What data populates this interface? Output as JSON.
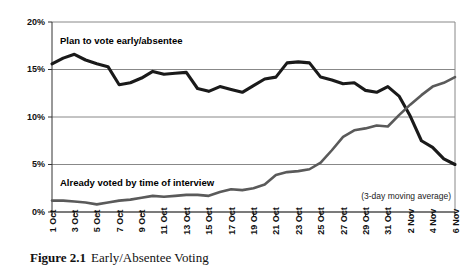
{
  "caption": {
    "number": "Figure 2.1",
    "title": "Early/Absentee Voting"
  },
  "annotations": {
    "series1_label": "Plan to vote early/absentee",
    "series2_label": "Already voted by time of interview",
    "note": "(3-day moving average)"
  },
  "colors": {
    "series1": "#1a1a1a",
    "series2": "#5a5a5a",
    "grid": "#888888",
    "axis": "#333333",
    "background": "#ffffff"
  },
  "chart_data": {
    "type": "line",
    "title": "Early/Absentee Voting",
    "xlabel": "",
    "ylabel": "",
    "ylim": [
      0,
      20
    ],
    "yticks": [
      0,
      5,
      10,
      15,
      20
    ],
    "ytick_labels": [
      "0%",
      "5%",
      "10%",
      "15%",
      "20%"
    ],
    "grid": true,
    "legend": "inline-annotation",
    "x": [
      "1 Oct",
      "2 Oct",
      "3 Oct",
      "4 Oct",
      "5 Oct",
      "6 Oct",
      "7 Oct",
      "8 Oct",
      "9 Oct",
      "10 Oct",
      "11 Oct",
      "12 Oct",
      "13 Oct",
      "14 Oct",
      "15 Oct",
      "16 Oct",
      "17 Oct",
      "18 Oct",
      "19 Oct",
      "20 Oct",
      "21 Oct",
      "22 Oct",
      "23 Oct",
      "24 Oct",
      "25 Oct",
      "26 Oct",
      "27 Oct",
      "28 Oct",
      "29 Oct",
      "30 Oct",
      "31 Oct",
      "1 Nov",
      "2 Nov",
      "3 Nov",
      "4 Nov",
      "5 Nov",
      "6 Nov"
    ],
    "xtick_labels": [
      "1 Oct",
      "3 Oct",
      "5 Oct",
      "7 Oct",
      "9 Oct",
      "11 Oct",
      "13 Oct",
      "15 Oct",
      "17 Oct",
      "19 Oct",
      "21 Oct",
      "23 Oct",
      "25 Oct",
      "27 Oct",
      "29 Oct",
      "31 Oct",
      "2 Nov",
      "4 Nov",
      "6 Nov"
    ],
    "series": [
      {
        "name": "Plan to vote early/absentee",
        "color": "#1a1a1a",
        "values": [
          15.6,
          16.2,
          16.6,
          16.0,
          15.6,
          15.3,
          13.4,
          13.6,
          14.1,
          14.8,
          14.5,
          14.6,
          14.7,
          13.0,
          12.7,
          13.2,
          12.9,
          12.6,
          13.3,
          14.0,
          14.2,
          15.7,
          15.8,
          15.7,
          14.2,
          13.9,
          13.5,
          13.6,
          12.8,
          12.6,
          13.2,
          12.2,
          10.1,
          7.5,
          6.8,
          5.6,
          5.0
        ]
      },
      {
        "name": "Already voted by time of interview",
        "color": "#5a5a5a",
        "values": [
          1.2,
          1.2,
          1.1,
          1.0,
          0.8,
          1.0,
          1.2,
          1.3,
          1.5,
          1.7,
          1.6,
          1.7,
          1.8,
          1.8,
          1.7,
          2.1,
          2.4,
          2.3,
          2.5,
          2.9,
          3.9,
          4.2,
          4.3,
          4.5,
          5.2,
          6.5,
          7.9,
          8.6,
          8.8,
          9.1,
          9.0,
          10.2,
          11.3,
          12.3,
          13.2,
          13.6,
          14.2
        ]
      }
    ]
  }
}
